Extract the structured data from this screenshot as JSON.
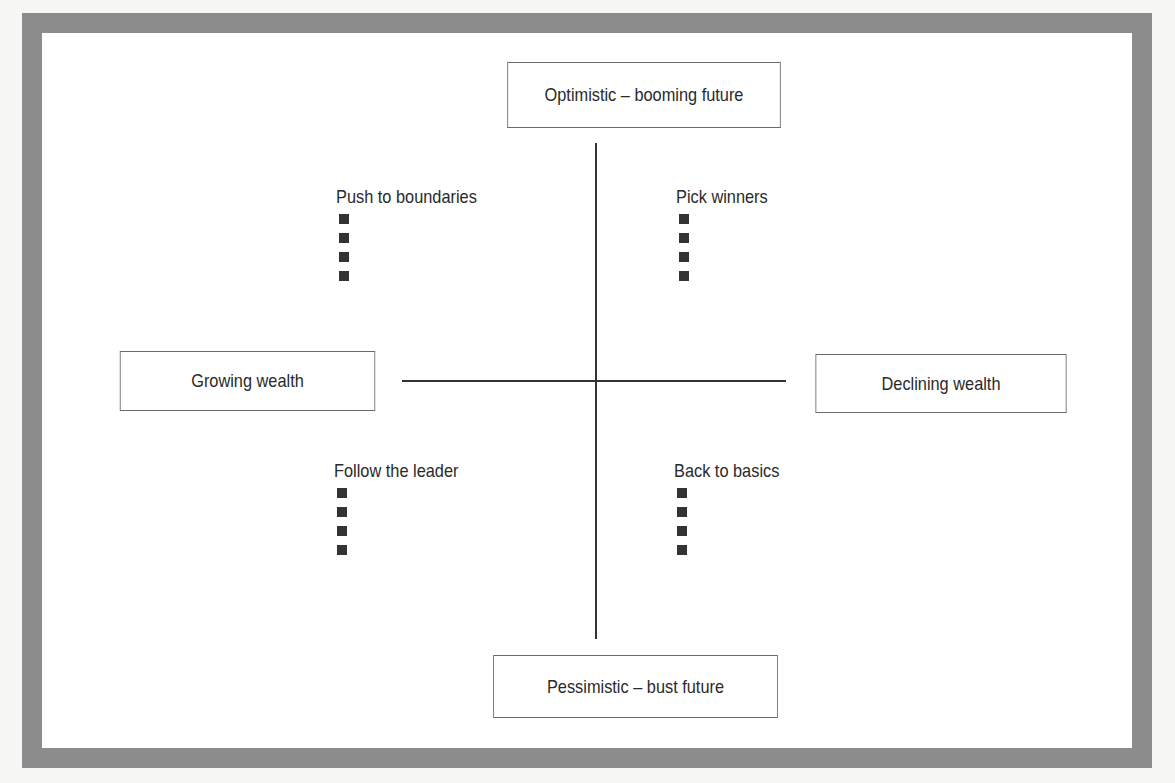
{
  "diagram": {
    "type": "2x2 scenario matrix",
    "axes": {
      "top": "Optimistic – booming future",
      "bottom": "Pessimistic – bust future",
      "left": "Growing wealth",
      "right": "Declining wealth"
    },
    "quadrants": [
      {
        "position": "top-left",
        "title": "Push to boundaries",
        "bullet_count": 4
      },
      {
        "position": "top-right",
        "title": "Pick winners",
        "bullet_count": 4
      },
      {
        "position": "bottom-left",
        "title": "Follow the leader",
        "bullet_count": 4
      },
      {
        "position": "bottom-right",
        "title": "Back to basics",
        "bullet_count": 4
      }
    ],
    "colors": {
      "frame": "#8c8c8c",
      "lines": "#333333",
      "bullets": "#333333",
      "text": "#2a2a2a"
    }
  }
}
